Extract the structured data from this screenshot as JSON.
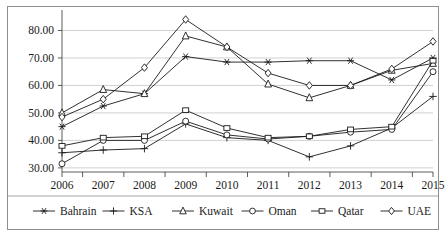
{
  "chart_data": {
    "type": "line",
    "title": "",
    "subtitle": "",
    "xlabel": "",
    "ylabel": "",
    "categories": [
      "2006",
      "2007",
      "2008",
      "2009",
      "2010",
      "2011",
      "2012",
      "2013",
      "2014",
      "2015"
    ],
    "x": [
      2006,
      2007,
      2008,
      2009,
      2010,
      2011,
      2012,
      2013,
      2014,
      2015
    ],
    "ylim": [
      28.5,
      86.0
    ],
    "ytick_labels": [
      "30.00",
      "40.00",
      "50.00",
      "60.00",
      "70.00",
      "80.00"
    ],
    "ytick_values": [
      30,
      40,
      50,
      60,
      70,
      80
    ],
    "grid": "horizontal",
    "legend_position": "bottom",
    "series": [
      {
        "name": "Bahrain",
        "marker": "star",
        "values": [
          45.0,
          52.5,
          57.0,
          70.5,
          68.5,
          68.5,
          69.0,
          69.0,
          62.0,
          70.0
        ]
      },
      {
        "name": "KSA",
        "marker": "plus",
        "values": [
          35.5,
          36.5,
          37.0,
          46.0,
          41.0,
          40.0,
          34.0,
          38.0,
          44.5,
          56.0
        ]
      },
      {
        "name": "Kuwait",
        "marker": "triangle",
        "values": [
          50.0,
          58.5,
          57.0,
          78.0,
          74.0,
          60.5,
          55.5,
          60.0,
          65.5,
          68.0
        ]
      },
      {
        "name": "Oman",
        "marker": "circle",
        "values": [
          31.5,
          40.0,
          40.0,
          47.0,
          42.0,
          40.5,
          41.5,
          43.0,
          44.0,
          65.0
        ]
      },
      {
        "name": "Qatar",
        "marker": "square",
        "values": [
          38.0,
          41.0,
          41.5,
          51.0,
          44.5,
          41.0,
          41.5,
          44.0,
          45.0,
          69.0
        ]
      },
      {
        "name": "UAE",
        "marker": "diamond",
        "values": [
          48.5,
          55.0,
          66.5,
          84.0,
          74.0,
          64.5,
          60.0,
          60.0,
          66.0,
          76.0
        ]
      }
    ]
  },
  "legend": {
    "items": [
      {
        "label": "Bahrain",
        "marker": "star"
      },
      {
        "label": "KSA",
        "marker": "plus"
      },
      {
        "label": "Kuwait",
        "marker": "triangle"
      },
      {
        "label": "Oman",
        "marker": "circle"
      },
      {
        "label": "Qatar",
        "marker": "square"
      },
      {
        "label": "UAE",
        "marker": "diamond"
      }
    ]
  },
  "colors": {
    "line": "#1a1a1a",
    "grid": "#bdbdbd",
    "axis": "#4a4a4a",
    "frame": "#8e8e8e",
    "background": "#ffffff",
    "text": "#1a1a1a"
  }
}
